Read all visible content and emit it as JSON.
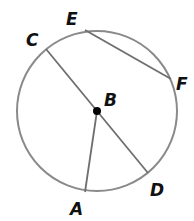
{
  "diagram": {
    "type": "circle-geometry",
    "center": {
      "label": "B",
      "x": 97,
      "y": 111
    },
    "radius": 80,
    "colors": {
      "circle": "#8a8a8a",
      "segment": "#6e6e6e",
      "center_dot": "#000000",
      "label": "#111111"
    },
    "points": [
      {
        "label": "A",
        "x": 85,
        "y": 192,
        "lx": 70,
        "ly": 215
      },
      {
        "label": "C",
        "x": 46,
        "y": 49,
        "lx": 26,
        "ly": 46
      },
      {
        "label": "D",
        "x": 148,
        "y": 173,
        "lx": 150,
        "ly": 196
      },
      {
        "label": "E",
        "x": 85,
        "y": 30,
        "lx": 66,
        "ly": 25
      },
      {
        "label": "F",
        "x": 171,
        "y": 79,
        "lx": 176,
        "ly": 90
      }
    ],
    "segments": [
      {
        "name": "diameter-CD",
        "from": "C",
        "to": "D"
      },
      {
        "name": "radius-BA",
        "from": "B",
        "to": "A"
      },
      {
        "name": "chord-EF",
        "from": "E",
        "to": "F"
      }
    ],
    "labels": {
      "A": "A",
      "B": "B",
      "C": "C",
      "D": "D",
      "E": "E",
      "F": "F"
    }
  }
}
